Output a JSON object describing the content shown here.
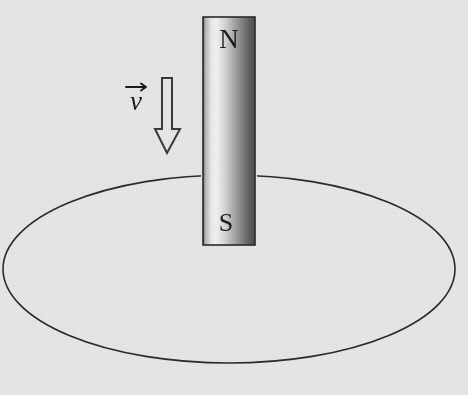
{
  "figure": {
    "background_color": "#e9e9e9",
    "ink_color": "#1b1b1b"
  },
  "magnet": {
    "north_label": "N",
    "south_label": "S",
    "body_color_light": "#f2f2f2",
    "body_color_dark": "#4a4a4a",
    "outline_color": "#2a2a2a",
    "x": 203,
    "y": 17,
    "width": 52,
    "height": 228
  },
  "velocity": {
    "label": "v",
    "vector_notation": "arrow-over",
    "direction": "down",
    "arrow_fill": "#e9e9e9",
    "arrow_outline": "#3a3a3a",
    "label_x": 138,
    "label_y": 108
  },
  "loop": {
    "name": "conducting loop",
    "shape": "ellipse",
    "stroke_color": "#2b2b2b",
    "stroke_width": 1.6,
    "center_x": 229,
    "center_y": 269,
    "radius_x": 226,
    "radius_y": 94
  }
}
